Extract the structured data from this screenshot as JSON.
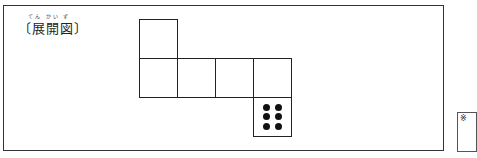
{
  "header_fragment": "",
  "figure": {
    "ruby": "てん かい ず",
    "title": "〔展開図〕"
  },
  "net": {
    "faces": [
      {
        "id": "top",
        "pips": 0
      },
      {
        "id": "row-1",
        "pips": 0
      },
      {
        "id": "row-2",
        "pips": 0
      },
      {
        "id": "row-3",
        "pips": 0
      },
      {
        "id": "row-4",
        "pips": 0
      },
      {
        "id": "bottom",
        "pips": 6
      }
    ]
  },
  "note": {
    "mark": "※"
  }
}
